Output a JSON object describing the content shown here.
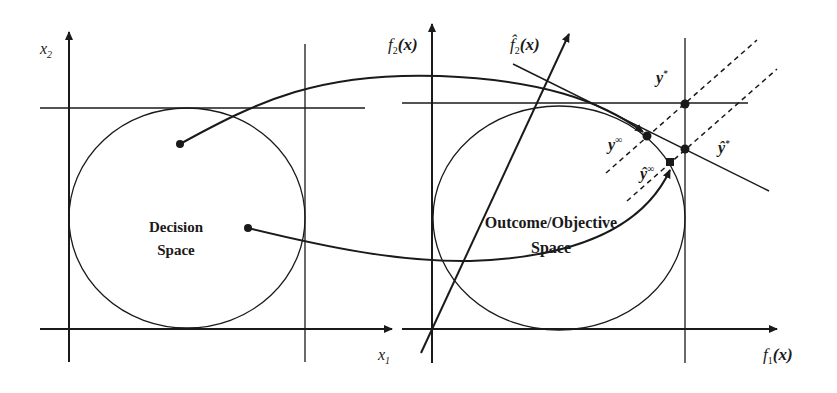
{
  "colors": {
    "ink": "#1a1a1a",
    "background": "#ffffff"
  },
  "left_panel": {
    "title_line1": "Decision",
    "title_line2": "Space",
    "x_axis_label": "x",
    "x_axis_sub": "1",
    "y_axis_label": "x",
    "y_axis_sub": "2"
  },
  "right_panel": {
    "title_line1": "Outcome/Objective",
    "title_line2": "Space",
    "x_axis_label": "f",
    "x_axis_sub": "1",
    "x_axis_arg": "(x)",
    "y_axis_label": "f",
    "y_axis_sub": "2",
    "y_axis_arg": "(x)",
    "rotated_axis_label": "f̂",
    "rotated_axis_sub": "2",
    "rotated_axis_arg": "(x)",
    "points": {
      "ideal": {
        "label": "y",
        "sup": "*"
      },
      "utopia": {
        "label": "y",
        "sup": "∞"
      },
      "ideal_hat": {
        "label": "ŷ",
        "sup": "*"
      },
      "utopia_hat": {
        "label": "ŷ",
        "sup": "∞"
      }
    }
  }
}
